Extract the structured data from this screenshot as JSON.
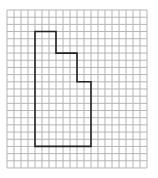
{
  "figure": {
    "type": "grid-polygon",
    "grid": {
      "cols": 20,
      "rows": 22,
      "origin_x": 7,
      "origin_y": 10,
      "cell_w": 7,
      "cell_h": 7.18,
      "line_color": "#b4b4b4"
    },
    "shape": {
      "stroke_color": "#222222",
      "stroke_width": 1.6,
      "vertices_grid": [
        [
          4,
          3
        ],
        [
          7,
          3
        ],
        [
          7,
          6
        ],
        [
          10,
          6
        ],
        [
          10,
          10
        ],
        [
          12,
          10
        ],
        [
          12,
          19
        ],
        [
          4,
          19
        ]
      ]
    }
  }
}
